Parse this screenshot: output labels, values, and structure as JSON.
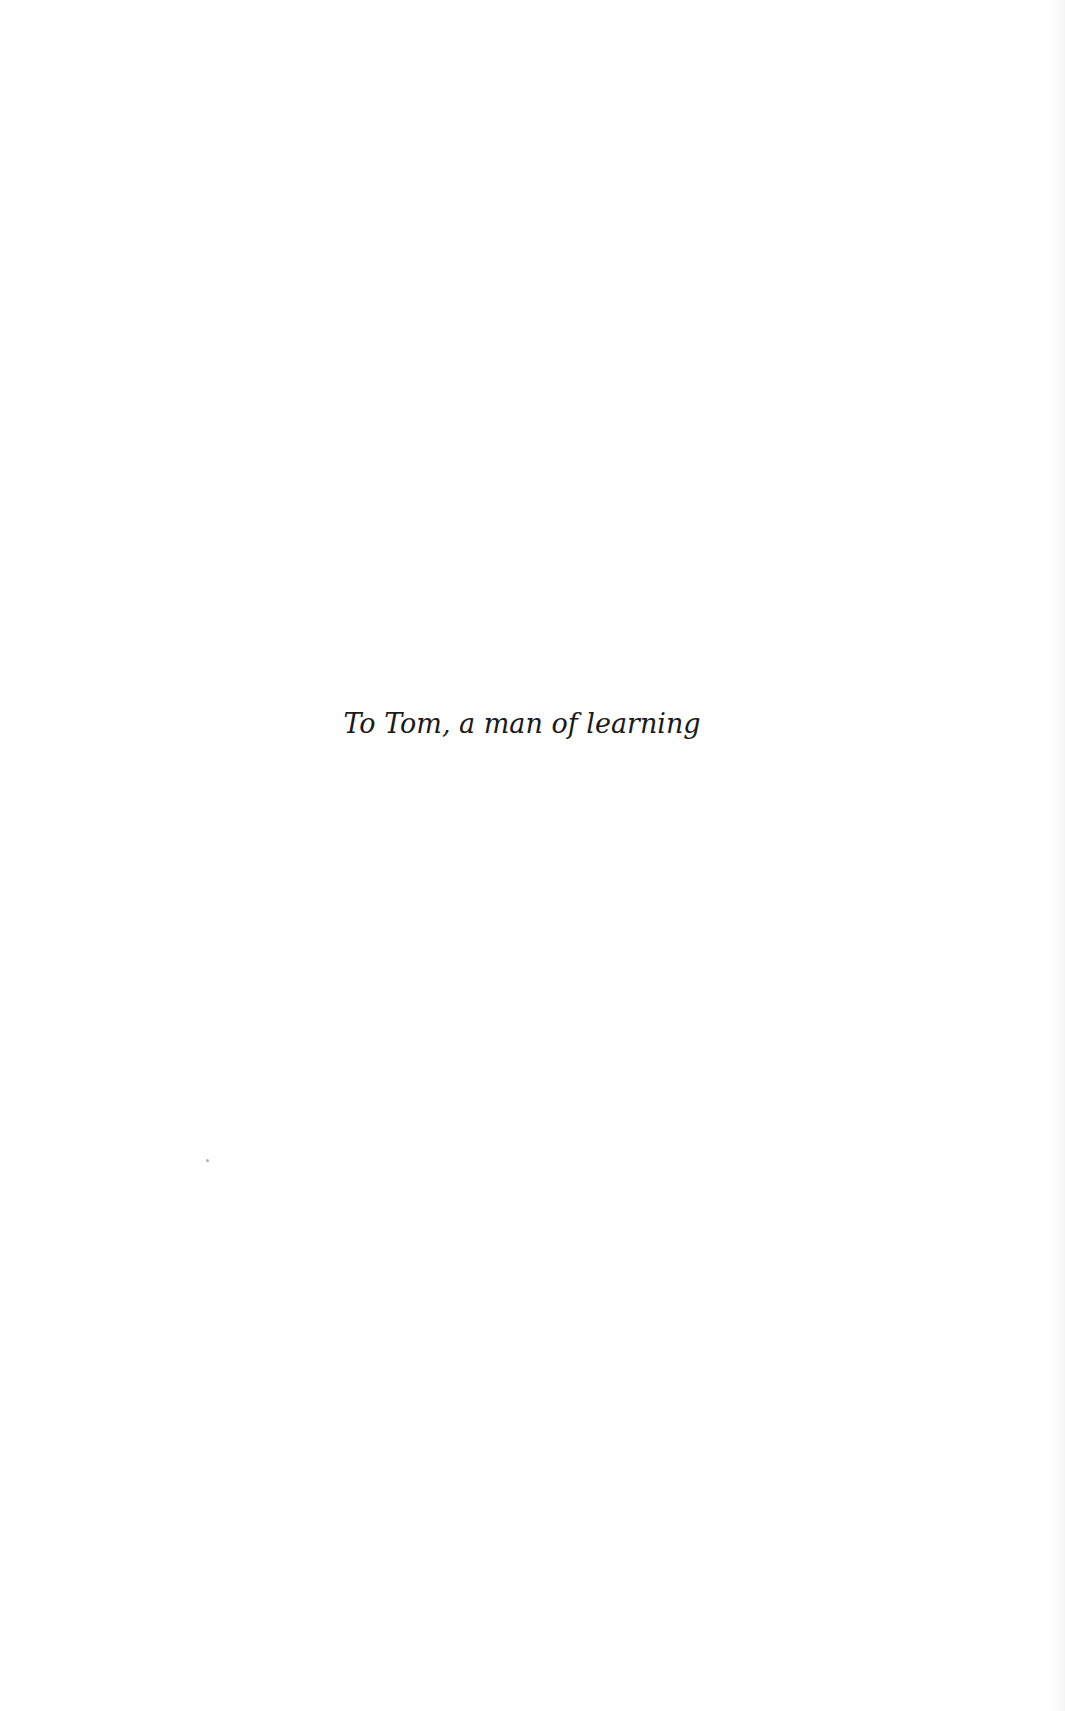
{
  "page": {
    "background_color": "#ffffff",
    "text_color": "#1a1a1a",
    "dedication": {
      "text": "To Tom, a man of learning"
    }
  }
}
